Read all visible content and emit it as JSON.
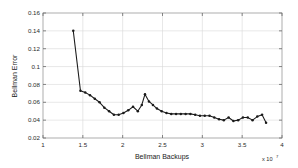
{
  "chart_data": {
    "type": "line",
    "title": "",
    "xlabel": "Bellman Backups",
    "ylabel": "Bellman Error",
    "x_multiplier": "x 10",
    "x_exponent": "7",
    "xlim": [
      1,
      4
    ],
    "ylim": [
      0.02,
      0.16
    ],
    "xticks": [
      "1",
      "1.5",
      "2",
      "2.5",
      "3",
      "3.5",
      "4"
    ],
    "xtick_values": [
      1,
      1.5,
      2,
      2.5,
      3,
      3.5,
      4
    ],
    "yticks": [
      "0.02",
      "0.04",
      "0.06",
      "0.08",
      "0.1",
      "0.12",
      "0.14",
      "0.16"
    ],
    "ytick_values": [
      0.02,
      0.04,
      0.06,
      0.08,
      0.1,
      0.12,
      0.14,
      0.16
    ],
    "grid": true,
    "legend": null,
    "marker": "filled-circle",
    "line_color": "#1a1a1a",
    "series": [
      {
        "name": "Bellman Error",
        "x": [
          1.38,
          1.47,
          1.53,
          1.59,
          1.65,
          1.71,
          1.77,
          1.83,
          1.89,
          1.95,
          2.01,
          2.07,
          2.13,
          2.19,
          2.24,
          2.28,
          2.33,
          2.38,
          2.43,
          2.49,
          2.55,
          2.61,
          2.67,
          2.73,
          2.79,
          2.85,
          2.91,
          2.97,
          3.03,
          3.09,
          3.15,
          3.21,
          3.27,
          3.33,
          3.39,
          3.45,
          3.51,
          3.57,
          3.63,
          3.69,
          3.75,
          3.8
        ],
        "y": [
          0.14,
          0.073,
          0.071,
          0.068,
          0.064,
          0.06,
          0.054,
          0.05,
          0.046,
          0.046,
          0.048,
          0.051,
          0.055,
          0.05,
          0.057,
          0.069,
          0.061,
          0.057,
          0.053,
          0.05,
          0.048,
          0.047,
          0.047,
          0.047,
          0.047,
          0.047,
          0.046,
          0.045,
          0.045,
          0.045,
          0.043,
          0.041,
          0.04,
          0.043,
          0.039,
          0.04,
          0.043,
          0.043,
          0.04,
          0.044,
          0.046,
          0.037
        ]
      }
    ]
  }
}
